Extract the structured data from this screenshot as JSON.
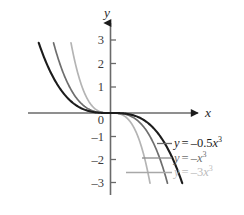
{
  "chart_data": {
    "type": "line",
    "title": "",
    "xlabel": "x",
    "ylabel": "y",
    "xlim": [
      -3.6,
      3.8
    ],
    "ylim": [
      -3.3,
      3.3
    ],
    "grid": false,
    "legend_position": "inline-right",
    "axis_arrows": true,
    "x_ticks": [],
    "y_ticks": [
      3,
      2,
      1,
      0,
      -1,
      -2,
      -3
    ],
    "y_tick_labels": [
      "3",
      "2",
      "1",
      "0",
      "–1",
      "–2",
      "–3"
    ],
    "series": [
      {
        "name": "y = -0.5x^3",
        "coefficient": -0.5,
        "color": "#1c1c1c",
        "label_parts": {
          "lhs": "y",
          "eq": "=",
          "rhs_coef": "–0.5",
          "rhs_var": "x",
          "rhs_exp": "3"
        },
        "points": [
          {
            "x": -1.817,
            "y": 3.0
          },
          {
            "x": -1.6,
            "y": 2.048
          },
          {
            "x": -1.4,
            "y": 1.372
          },
          {
            "x": -1.2,
            "y": 0.864
          },
          {
            "x": -1.0,
            "y": 0.5
          },
          {
            "x": -0.8,
            "y": 0.256
          },
          {
            "x": -0.5,
            "y": 0.0625
          },
          {
            "x": 0.0,
            "y": 0.0
          },
          {
            "x": 0.5,
            "y": -0.0625
          },
          {
            "x": 0.8,
            "y": -0.256
          },
          {
            "x": 1.0,
            "y": -0.5
          },
          {
            "x": 1.2,
            "y": -0.864
          },
          {
            "x": 1.4,
            "y": -1.372
          },
          {
            "x": 1.6,
            "y": -2.048
          },
          {
            "x": 1.817,
            "y": -3.0
          }
        ]
      },
      {
        "name": "y = -x^3",
        "coefficient": -1.0,
        "color": "#6e6e6e",
        "label_parts": {
          "lhs": "y",
          "eq": "=",
          "rhs_coef": "–",
          "rhs_var": "x",
          "rhs_exp": "3"
        },
        "points": [
          {
            "x": -1.442,
            "y": 3.0
          },
          {
            "x": -1.3,
            "y": 2.197
          },
          {
            "x": -1.1,
            "y": 1.331
          },
          {
            "x": -1.0,
            "y": 1.0
          },
          {
            "x": -0.8,
            "y": 0.512
          },
          {
            "x": -0.5,
            "y": 0.125
          },
          {
            "x": 0.0,
            "y": 0.0
          },
          {
            "x": 0.5,
            "y": -0.125
          },
          {
            "x": 0.8,
            "y": -0.512
          },
          {
            "x": 1.0,
            "y": -1.0
          },
          {
            "x": 1.1,
            "y": -1.331
          },
          {
            "x": 1.3,
            "y": -2.197
          },
          {
            "x": 1.442,
            "y": -3.0
          }
        ]
      },
      {
        "name": "y = -3x^3",
        "coefficient": -3.0,
        "color": "#b4b4b4",
        "label_parts": {
          "lhs": "y",
          "eq": "=",
          "rhs_coef": "–3",
          "rhs_var": "x",
          "rhs_exp": "3"
        },
        "points": [
          {
            "x": -1.0,
            "y": 3.0
          },
          {
            "x": -0.9,
            "y": 2.187
          },
          {
            "x": -0.8,
            "y": 1.536
          },
          {
            "x": -0.7,
            "y": 1.029
          },
          {
            "x": -0.5,
            "y": 0.375
          },
          {
            "x": -0.3,
            "y": 0.081
          },
          {
            "x": 0.0,
            "y": 0.0
          },
          {
            "x": 0.3,
            "y": -0.081
          },
          {
            "x": 0.5,
            "y": -0.375
          },
          {
            "x": 0.7,
            "y": -1.029
          },
          {
            "x": 0.8,
            "y": -1.536
          },
          {
            "x": 0.9,
            "y": -2.187
          },
          {
            "x": 1.0,
            "y": -3.0
          }
        ]
      }
    ]
  },
  "axes": {
    "y_axis_name": "y",
    "x_axis_name": "x"
  },
  "y_tick_labels": {
    "t3": "3",
    "t2": "2",
    "t1": "1",
    "t0": "0",
    "tm1": "–1",
    "tm2": "–2",
    "tm3": "–3"
  },
  "labels": {
    "curve1": {
      "lhs": "y",
      "eq": "=",
      "rhs": "–0.5",
      "var": "x",
      "exp": "3"
    },
    "curve2": {
      "lhs": "y",
      "eq": "=",
      "rhs": "–",
      "var": "x",
      "exp": "3"
    },
    "curve3": {
      "lhs": "y",
      "eq": "=",
      "rhs": "–3",
      "var": "x",
      "exp": "3"
    }
  }
}
